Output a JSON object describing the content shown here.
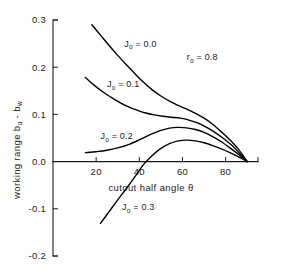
{
  "chart_data": {
    "type": "line",
    "title": "",
    "xlabel": "cutout half angle θ",
    "ylabel": "working range  bᵤ - bᵤᵤ",
    "ylabel_parts": {
      "prefix": "working range",
      "symbol_b1": "b",
      "symbol_b1_sub": "u",
      "minus": "-",
      "symbol_b2": "b",
      "symbol_b2_sub": "w"
    },
    "xlim": [
      0,
      95
    ],
    "ylim": [
      -0.2,
      0.3
    ],
    "xticks": [
      20,
      40,
      60,
      80
    ],
    "xtick_labels": [
      "20",
      "40",
      "60",
      "80"
    ],
    "yticks": [
      -0.2,
      -0.1,
      0.0,
      0.1,
      0.2,
      0.3
    ],
    "ytick_labels": [
      "-0.2",
      "-0.1",
      "0.0",
      "0.1",
      "0.2",
      "0.3"
    ],
    "grid": false,
    "legend_position": "inline-annotations",
    "annotations": [
      {
        "text": "r",
        "sub": "o",
        "value": " = 0.8",
        "x": 62,
        "y": 0.215
      }
    ],
    "series": [
      {
        "name": "J₀ = 0.0",
        "label_prefix": "J",
        "label_sub": "o",
        "label_value": " = 0.0",
        "label_x": 33,
        "label_y": 0.243,
        "x": [
          18,
          22,
          26,
          30,
          34,
          38,
          42,
          46,
          50,
          54,
          58,
          62,
          66,
          70,
          74,
          78,
          82,
          86,
          90
        ],
        "y": [
          0.29,
          0.268,
          0.246,
          0.225,
          0.205,
          0.186,
          0.168,
          0.152,
          0.139,
          0.128,
          0.119,
          0.111,
          0.102,
          0.092,
          0.079,
          0.063,
          0.046,
          0.026,
          0.0
        ]
      },
      {
        "name": "J₀ = 0.1",
        "label_prefix": "J",
        "label_sub": "o",
        "label_value": " = 0.1",
        "label_x": 25,
        "label_y": 0.157,
        "x": [
          15,
          19,
          23,
          27,
          31,
          35,
          39,
          43,
          47,
          51,
          55,
          59,
          63,
          67,
          71,
          75,
          79,
          83,
          87,
          90
        ],
        "y": [
          0.178,
          0.162,
          0.148,
          0.136,
          0.125,
          0.116,
          0.109,
          0.103,
          0.099,
          0.096,
          0.094,
          0.092,
          0.088,
          0.082,
          0.073,
          0.062,
          0.049,
          0.034,
          0.015,
          0.0
        ]
      },
      {
        "name": "J₀ = 0.2",
        "label_prefix": "J",
        "label_sub": "o",
        "label_value": " = 0.2",
        "label_x": 22,
        "label_y": 0.047,
        "x": [
          15,
          20,
          25,
          30,
          35,
          40,
          45,
          50,
          54,
          58,
          62,
          66,
          70,
          74,
          78,
          82,
          86,
          90
        ],
        "y": [
          0.019,
          0.021,
          0.024,
          0.029,
          0.036,
          0.046,
          0.057,
          0.066,
          0.071,
          0.0725,
          0.0715,
          0.068,
          0.062,
          0.053,
          0.042,
          0.029,
          0.015,
          0.0
        ]
      },
      {
        "name": "J₀ = 0.3",
        "label_prefix": "J",
        "label_sub": "o",
        "label_value": " = 0.3",
        "label_x": 32,
        "label_y": -0.103,
        "x": [
          22,
          26,
          30,
          34,
          38,
          42,
          46,
          50,
          54,
          58,
          62,
          66,
          70,
          74,
          78,
          82,
          86,
          90
        ],
        "y": [
          -0.131,
          -0.106,
          -0.081,
          -0.057,
          -0.032,
          -0.006,
          0.013,
          0.028,
          0.038,
          0.044,
          0.0455,
          0.044,
          0.04,
          0.034,
          0.027,
          0.019,
          0.01,
          0.0
        ]
      }
    ]
  }
}
